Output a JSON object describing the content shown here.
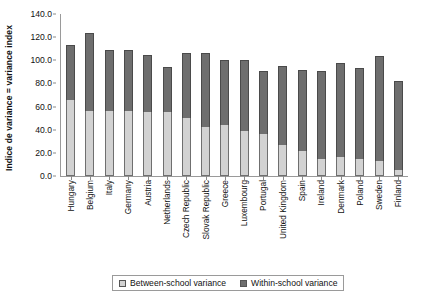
{
  "chart_data": {
    "type": "bar",
    "stacked": true,
    "title": "",
    "xlabel": "",
    "ylabel": "Indice de variance = variance index",
    "ylim": [
      0.0,
      140.0
    ],
    "ytick_step": 20.0,
    "ytick_labels": [
      "140.0",
      "120.0",
      "100.0",
      "80.0",
      "60.0",
      "40.0",
      "20.0",
      "0.0"
    ],
    "ytick_values": [
      140.0,
      120.0,
      100.0,
      80.0,
      60.0,
      40.0,
      20.0,
      0.0
    ],
    "grid": false,
    "legend_position": "bottom",
    "categories": [
      "Hungary",
      "Belgium",
      "Italy",
      "Germany",
      "Austria",
      "Netherlands",
      "Czech Republic",
      "Slovak Republic",
      "Greece",
      "Luxembourg",
      "Portugal",
      "United Kingdom",
      "Spain",
      "Ireland",
      "Denmark",
      "Poland",
      "Sweden",
      "Finland"
    ],
    "series": [
      {
        "name": "Between-school variance",
        "color": "#d2d2d2",
        "values": [
          66.0,
          56.5,
          56.5,
          56.5,
          55.5,
          55.0,
          50.5,
          42.0,
          44.5,
          38.5,
          36.5,
          27.0,
          21.5,
          15.0,
          16.5,
          14.5,
          13.0,
          5.0
        ]
      },
      {
        "name": "Within-school variance",
        "color": "#6e6e6e",
        "values": [
          47.0,
          67.5,
          52.5,
          52.5,
          49.5,
          39.0,
          55.5,
          64.5,
          56.0,
          61.5,
          54.5,
          68.5,
          70.0,
          76.0,
          81.0,
          78.5,
          91.0,
          77.0
        ]
      }
    ],
    "totals": [
      113.0,
      124.0,
      109.0,
      109.0,
      105.0,
      94.0,
      106.0,
      106.5,
      100.5,
      100.0,
      91.0,
      95.5,
      91.5,
      91.0,
      97.5,
      93.0,
      104.0,
      82.0
    ]
  },
  "legend": {
    "items": [
      {
        "label": "Between-school variance",
        "swatch": "light-gray-swatch"
      },
      {
        "label": "Within-school variance",
        "swatch": "dark-gray-swatch"
      }
    ]
  }
}
